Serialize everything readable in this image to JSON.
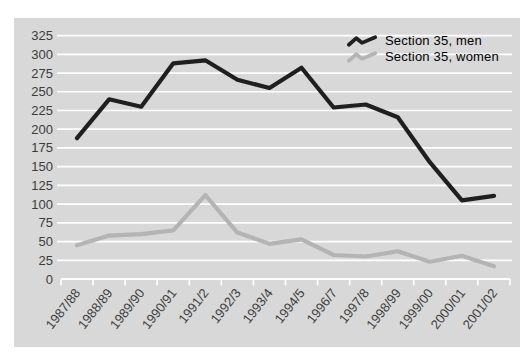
{
  "chart_data": {
    "type": "line",
    "title": "",
    "xlabel": "",
    "ylabel": "",
    "categories": [
      "1987/88",
      "1988/89",
      "1989/90",
      "1990/91",
      "1991/2",
      "1992/3",
      "1993/4",
      "1994/5",
      "1996/7",
      "1997/8",
      "1998/99",
      "1999/00",
      "2000/01",
      "2001/02"
    ],
    "series": [
      {
        "name": "Section 35, men",
        "color": "#1f1f1f",
        "values": [
          188,
          240,
          230,
          288,
          292,
          266,
          255,
          282,
          229,
          233,
          216,
          156,
          105,
          111
        ]
      },
      {
        "name": "Section 35, women",
        "color": "#b4b4b4",
        "values": [
          45,
          58,
          60,
          65,
          112,
          62,
          47,
          53,
          32,
          30,
          37,
          23,
          31,
          17
        ]
      }
    ],
    "ylim": [
      0,
      325
    ],
    "ytick_step": 25,
    "yticks": [
      0,
      25,
      50,
      75,
      100,
      125,
      150,
      175,
      200,
      225,
      250,
      275,
      300,
      325
    ],
    "grid": "horizontal-white-lines-on-gray-panel",
    "legend_position": "top-right-inside-plot"
  },
  "colors": {
    "panel_background": "#d8d8d8",
    "page_background": "#ffffff",
    "gridline": "#ffffff",
    "axis_text": "#3c3c3c"
  }
}
